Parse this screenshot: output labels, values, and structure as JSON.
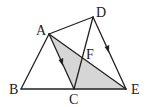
{
  "diagram": {
    "type": "geometry",
    "colors": {
      "line": "#222222",
      "shade": "#d6d6d6",
      "background": "#ffffff"
    },
    "points": {
      "A": {
        "label": "A",
        "x": 49,
        "y": 34
      },
      "B": {
        "label": "B",
        "x": 21,
        "y": 89
      },
      "C": {
        "label": "C",
        "x": 74,
        "y": 89
      },
      "D": {
        "label": "D",
        "x": 93,
        "y": 17
      },
      "E": {
        "label": "E",
        "x": 126,
        "y": 89
      },
      "F": {
        "label": "F",
        "x": 82,
        "y": 57
      }
    },
    "segments": [
      "AB",
      "BC",
      "CE",
      "AD",
      "DE",
      "DC",
      "AE",
      "AC"
    ],
    "shaded_region": [
      "A",
      "C",
      "E"
    ],
    "parallel_marks": [
      "AC",
      "DE"
    ]
  }
}
